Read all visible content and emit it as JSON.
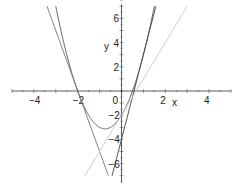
{
  "chart_data": {
    "type": "line",
    "title": "",
    "xlabel": "x",
    "ylabel": "y",
    "xlim": [
      -5,
      5
    ],
    "ylim": [
      -7,
      7
    ],
    "grid": false,
    "legend": null,
    "x_ticks": [
      -4,
      -2,
      0,
      2,
      4
    ],
    "x_tick_labels": [
      "-4",
      "-2",
      "0",
      "2",
      "4"
    ],
    "y_ticks": [
      -6,
      -4,
      -2,
      2,
      4,
      6
    ],
    "y_tick_labels": [
      "-6",
      "-4",
      "-2",
      "2",
      "4",
      "6"
    ],
    "series": [
      {
        "name": "parabola",
        "expression": "y = 2x^2 + 3x - 2",
        "color": "#555555",
        "x": [
          -3,
          -2,
          -1.5,
          -1,
          -0.75,
          -0.5,
          0,
          0.5,
          1,
          1.5
        ],
        "y": [
          7,
          0,
          -2,
          -3,
          -3.125,
          -3,
          -2,
          0,
          3,
          7
        ]
      },
      {
        "name": "tangent at x=-2",
        "expression": "y = -5x - 10",
        "color": "#777777",
        "x": [
          -3.4,
          -0.6
        ],
        "y": [
          7,
          -7
        ]
      },
      {
        "name": "tangent at x=1",
        "expression": "y = 7x - 4",
        "color": "#444444",
        "x": [
          -0.43,
          1.57
        ],
        "y": [
          -7,
          7
        ]
      },
      {
        "name": "tangent at x=0",
        "expression": "y = 3x - 2",
        "color": "#c8c8c8",
        "x": [
          -1.67,
          3
        ],
        "y": [
          -7,
          7
        ]
      }
    ]
  }
}
